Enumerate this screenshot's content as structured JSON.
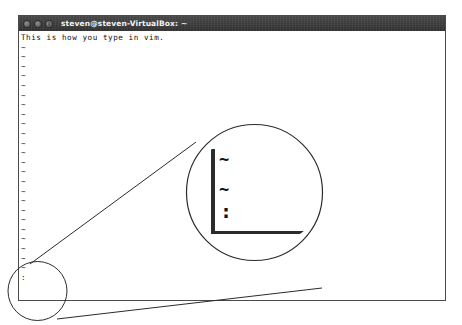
{
  "window": {
    "title": "steven@steven-VirtualBox: ~",
    "buttons": [
      {
        "name": "minimize",
        "label": ""
      },
      {
        "name": "maximize",
        "label": ""
      },
      {
        "name": "close",
        "label": ""
      }
    ],
    "titlebar_color": "#3a3a3a",
    "background_color": "#ffffff",
    "border_color": "#4a4a4a"
  },
  "terminal": {
    "first_line": "This is how you type in vim.",
    "tilde": "~",
    "cursor": ":",
    "tilde_rows": [
      "~",
      "~",
      "~",
      "~",
      "~",
      "~",
      "~",
      "~",
      "~",
      "~",
      "~",
      "~",
      "~",
      "~",
      "~",
      "~",
      "~",
      "~",
      "~",
      "~",
      "~",
      "~",
      "~",
      "~"
    ],
    "text_color": "#111111",
    "font_description": "monospace"
  },
  "callout": {
    "source_label": "bottom-left-corner-region",
    "magnifier_label": "magnified-vim-tildes",
    "glyphs": {
      "tilde_1": "~",
      "tilde_2": "~",
      "cursor": ":"
    },
    "line_color": "#2b2b2b"
  }
}
